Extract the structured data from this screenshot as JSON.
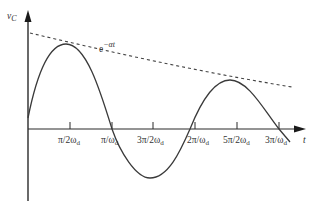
{
  "diagram": {
    "y_axis_label": "v",
    "y_axis_sub": "C",
    "x_axis_label": "t",
    "envelope_label_base": "e",
    "envelope_label_exp": "−αt",
    "ticks": [
      {
        "num": "π/2ω",
        "sub": "d"
      },
      {
        "num": "π/ω",
        "sub": "d"
      },
      {
        "num": "3π/2ω",
        "sub": "d"
      },
      {
        "num": "2π/ω",
        "sub": "d"
      },
      {
        "num": "5π/2ω",
        "sub": "d"
      },
      {
        "num": "3π/ω",
        "sub": "d"
      }
    ],
    "colors": {
      "curve": "#3a3a3a",
      "axis": "#2a2a2a",
      "text": "#333333"
    }
  }
}
